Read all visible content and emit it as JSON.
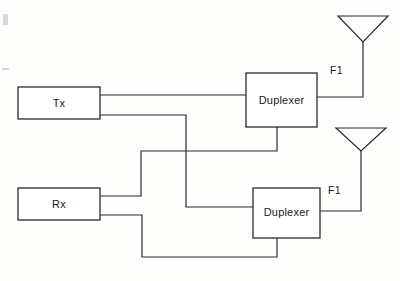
{
  "diagram": {
    "type": "block-diagram",
    "stroke_color": "#2b2b2b",
    "background_color": "#fdfdfc",
    "blocks": [
      {
        "id": "tx",
        "label": "Tx",
        "x": 18,
        "y": 87,
        "w": 82,
        "h": 32
      },
      {
        "id": "rx",
        "label": "Rx",
        "x": 18,
        "y": 188,
        "w": 82,
        "h": 32
      },
      {
        "id": "duplexer1",
        "label": "Duplexer",
        "x": 246,
        "y": 73,
        "w": 71,
        "h": 54
      },
      {
        "id": "duplexer2",
        "label": "Duplexer",
        "x": 253,
        "y": 188,
        "w": 67,
        "h": 50
      }
    ],
    "antennas": [
      {
        "id": "antenna-1",
        "label": "F1",
        "label_x": 330,
        "label_y": 64,
        "cx": 363,
        "top_y": 16,
        "apex_y": 42,
        "half_w": 25,
        "feed_y": 97
      },
      {
        "id": "antenna-2",
        "label": "F1",
        "label_x": 328,
        "label_y": 184,
        "cx": 361,
        "top_y": 128,
        "apex_y": 151,
        "half_w": 25,
        "feed_y": 211
      }
    ],
    "wires": [
      {
        "id": "tx-to-duplexer1",
        "from": "tx",
        "to": "duplexer1",
        "path": "M100,95 L246,95"
      },
      {
        "id": "tx-to-duplexer2",
        "from": "tx",
        "to": "duplexer2",
        "path": "M100,115 L186,115 L186,207 L253,207"
      },
      {
        "id": "duplexer1-to-rx",
        "from": "duplexer1",
        "to": "rx",
        "path": "M277,127 L277,151 L141,151 L141,196 L100,196"
      },
      {
        "id": "rx-to-duplexer2",
        "from": "rx",
        "to": "duplexer2",
        "path": "M100,215 L142,215 L142,257 L277,257 L277,238"
      },
      {
        "id": "duplexer1-to-antenna-1",
        "from": "duplexer1",
        "to": "antenna-1",
        "path": "M317,97 L363,97 L363,42"
      },
      {
        "id": "duplexer2-to-antenna-2",
        "from": "duplexer2",
        "to": "antenna-2",
        "path": "M320,211 L361,211 L361,151"
      }
    ]
  }
}
